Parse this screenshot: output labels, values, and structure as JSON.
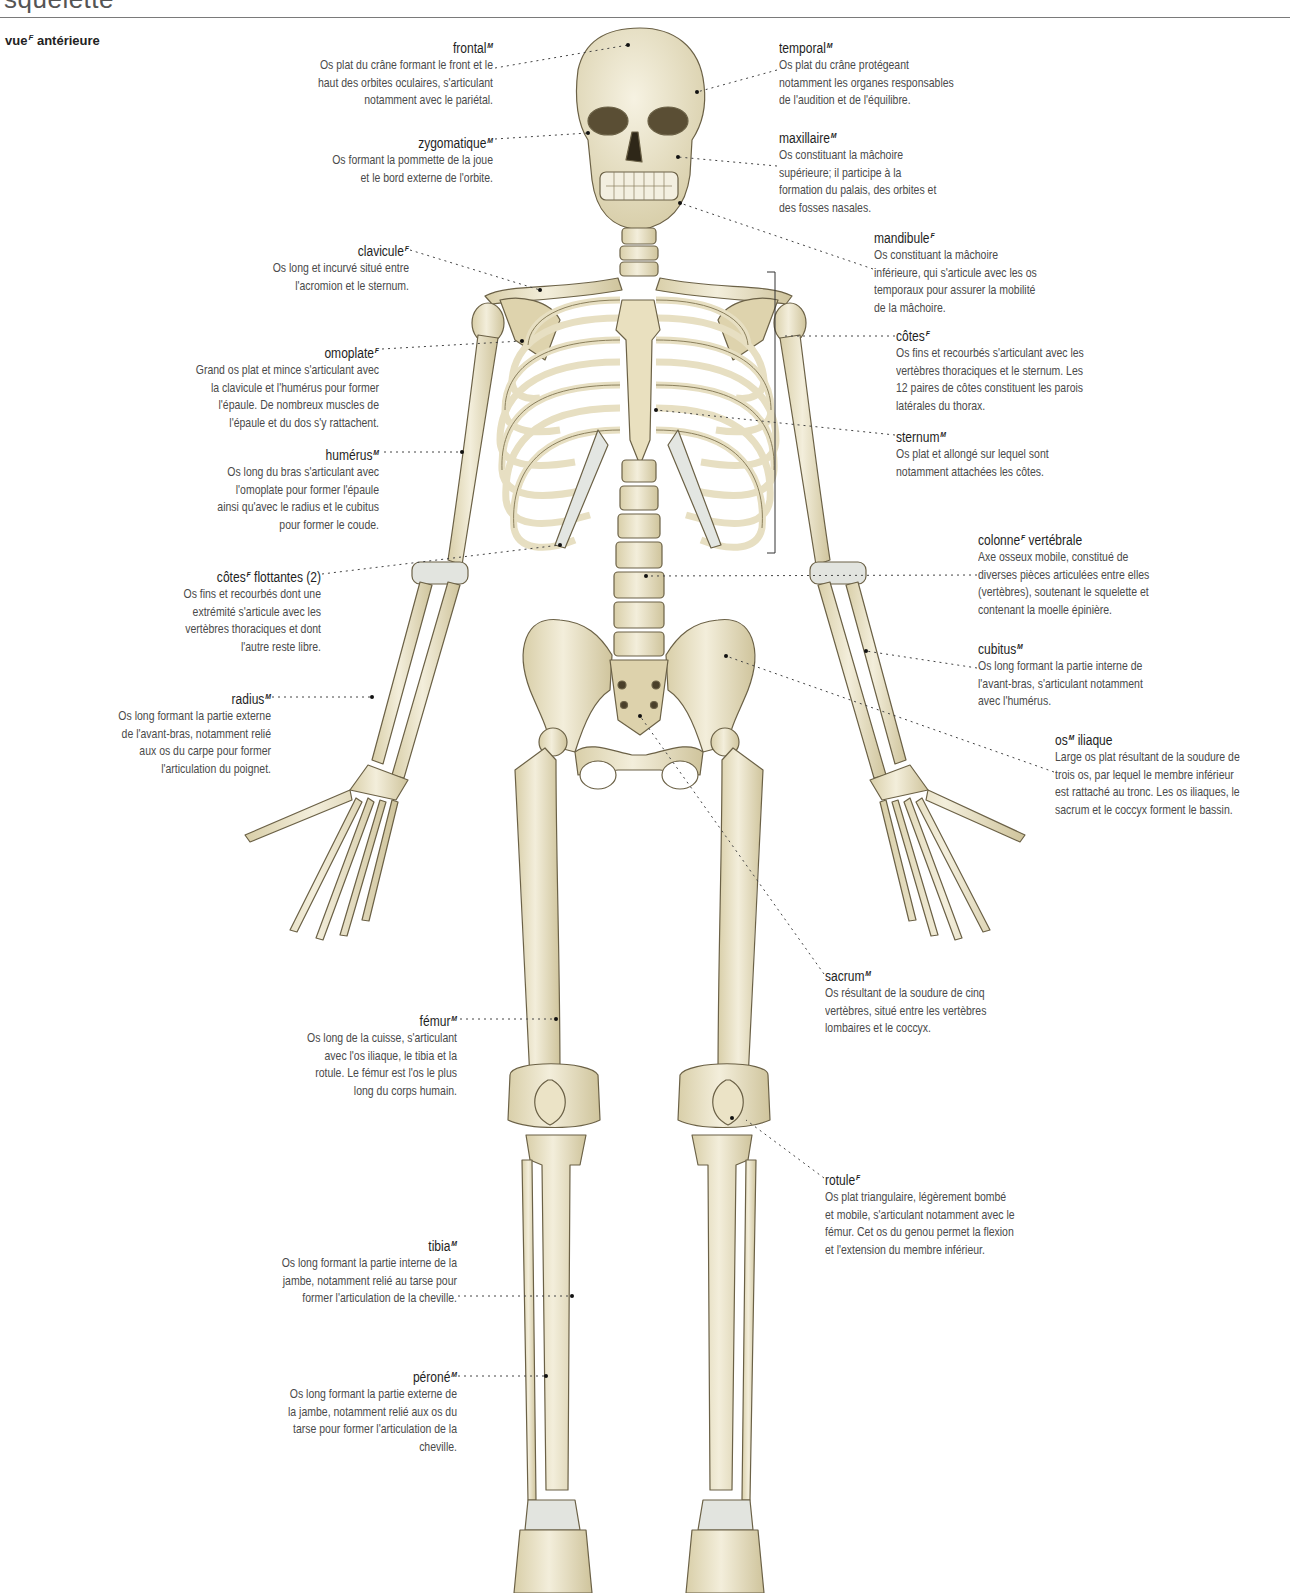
{
  "header": {
    "title": "squelette",
    "view_label": "vue",
    "view_gender": "F",
    "view_suffix": "antérieure"
  },
  "colors": {
    "bone": "#efe8cf",
    "bone_shadow": "#c9bf98",
    "outline": "#6b6146",
    "cartilage": "#dfe5e6",
    "leader": "#444444",
    "text": "#4a4a4a",
    "term": "#1e1e1e"
  },
  "labels": {
    "frontal": {
      "term": "frontal",
      "gender": "M",
      "desc": "Os plat du crâne formant le front et le\nhaut des orbites oculaires, s'articulant\nnotamment avec le pariétal."
    },
    "zygomatique": {
      "term": "zygomatique",
      "gender": "M",
      "desc": "Os formant la pommette de la joue\net le bord externe de l'orbite."
    },
    "clavicule": {
      "term": "clavicule",
      "gender": "F",
      "desc": "Os long et incurvé situé entre\nl'acromion et le sternum."
    },
    "omoplate": {
      "term": "omoplate",
      "gender": "F",
      "desc": "Grand os plat et mince s'articulant avec\nla clavicule et l'humérus pour former\nl'épaule. De nombreux muscles de\nl'épaule et du dos s'y rattachent."
    },
    "humerus": {
      "term": "humérus",
      "gender": "M",
      "desc": "Os long du bras s'articulant avec\nl'omoplate pour former l'épaule\nainsi qu'avec le radius et le cubitus\npour former le coude."
    },
    "cotes_flottantes": {
      "term": "côtes",
      "gender": "F",
      "term_suffix": "flottantes (2)",
      "desc": "Os fins et recourbés dont une\nextrémité s'articule avec les\nvertèbres thoraciques et dont\nl'autre reste libre."
    },
    "radius": {
      "term": "radius",
      "gender": "M",
      "desc": "Os long formant la partie externe\nde l'avant-bras, notamment relié\naux os du carpe pour former\nl'articulation du poignet."
    },
    "femur": {
      "term": "fémur",
      "gender": "M",
      "desc": "Os long de la cuisse, s'articulant\navec l'os iliaque, le tibia et la\nrotule. Le fémur est l'os le plus\nlong du corps humain."
    },
    "tibia": {
      "term": "tibia",
      "gender": "M",
      "desc": "Os long formant la partie interne de la\njambe, notamment relié au tarse pour\nformer l'articulation de la cheville."
    },
    "perone": {
      "term": "péroné",
      "gender": "M",
      "desc": "Os long formant la partie externe de\nla jambe, notamment relié aux os du\ntarse pour former l'articulation de la\ncheville."
    },
    "temporal": {
      "term": "temporal",
      "gender": "M",
      "desc": "Os plat du crâne protégeant\nnotamment les organes responsables\nde l'audition et de l'équilibre."
    },
    "maxillaire": {
      "term": "maxillaire",
      "gender": "M",
      "desc": "Os constituant la mâchoire\nsupérieure; il participe à la\nformation du palais, des orbites et\ndes fosses nasales."
    },
    "mandibule": {
      "term": "mandibule",
      "gender": "F",
      "desc": "Os constituant la mâchoire\ninférieure, qui s'articule avec les os\ntemporaux pour assurer la mobilité\nde la mâchoire."
    },
    "cotes": {
      "term": "côtes",
      "gender": "F",
      "desc": "Os fins et recourbés s'articulant avec les\nvertèbres thoraciques et le sternum. Les\n12 paires de côtes constituent les parois\nlatérales du thorax."
    },
    "sternum": {
      "term": "sternum",
      "gender": "M",
      "desc": "Os plat et allongé sur lequel sont\nnotamment attachées les côtes."
    },
    "colonne": {
      "term": "colonne",
      "gender": "F",
      "term_suffix": "vertébrale",
      "desc": "Axe osseux mobile, constitué de\ndiverses pièces articulées entre elles\n(vertèbres), soutenant le squelette et\ncontenant la moelle épinière."
    },
    "cubitus": {
      "term": "cubitus",
      "gender": "M",
      "desc": "Os long formant la partie interne de\nl'avant-bras, s'articulant notamment\navec l'humérus."
    },
    "os_iliaque": {
      "term": "os",
      "gender": "M",
      "term_suffix": "iliaque",
      "desc": "Large os plat résultant de la soudure de\ntrois os, par lequel le membre inférieur\nest rattaché au tronc. Les os iliaques, le\nsacrum et le coccyx forment le bassin."
    },
    "sacrum": {
      "term": "sacrum",
      "gender": "M",
      "desc": "Os résultant de la soudure de cinq\nvertèbres, situé entre les vertèbres\nlombaires et le coccyx."
    },
    "rotule": {
      "term": "rotule",
      "gender": "F",
      "desc": "Os plat triangulaire, légèrement bombé\net mobile, s'articulant notamment avec le\nfémur. Cet os du genou permet la flexion\net l'extension du membre inférieur."
    }
  }
}
